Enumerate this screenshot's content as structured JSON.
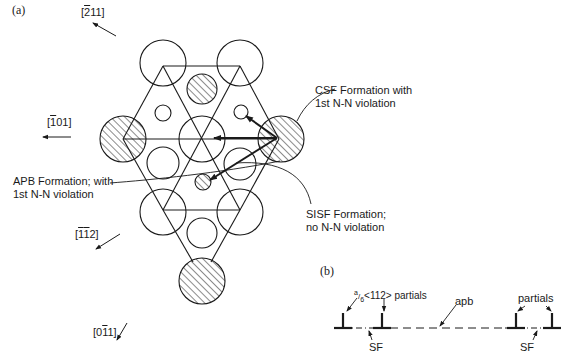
{
  "panel_a": {
    "label": "(a)",
    "directions": [
      {
        "id": "d211",
        "prefix": "[",
        "bar": "2",
        "rest": "11]"
      },
      {
        "id": "d101",
        "prefix": "[",
        "bar": "1",
        "rest": "01]"
      },
      {
        "id": "d112_a",
        "prefix": "[",
        "bar": "1",
        "mid_bar": "1",
        "rest": "2]"
      },
      {
        "id": "d011",
        "prefix": "[0",
        "bar": "1",
        "rest": "1]"
      }
    ],
    "annotations": {
      "csf_line1": "CSF Formation with",
      "csf_line2": "1st N-N violation",
      "apb_line1": "APB Formation; with",
      "apb_line2": "1st N-N violation",
      "sisf_line1": "SISF Formation;",
      "sisf_line2": "no N-N violation"
    }
  },
  "panel_b": {
    "label": "(b)",
    "partials_left": "a/6 <112> partials",
    "partials_left_frac_num": "a",
    "partials_left_frac_den": "6",
    "partials_left_rest": "<112> partials",
    "apb": "apb",
    "partials_right": "partials",
    "sf_left": "SF",
    "sf_right": "SF"
  },
  "colors": {
    "ink": "#1a1a1a",
    "background": "#ffffff"
  }
}
